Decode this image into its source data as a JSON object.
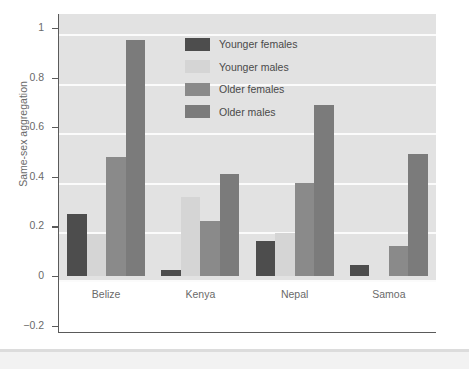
{
  "chart_data": {
    "type": "bar",
    "title": "",
    "xlabel": "Culture",
    "ylabel": "Same-sex aggregation",
    "categories": [
      "Belize",
      "Kenya",
      "Nepal",
      "Samoa"
    ],
    "series": [
      {
        "name": "Younger females",
        "color": "#4d4d4d",
        "values": [
          0.25,
          0.025,
          0.14,
          0.045
        ]
      },
      {
        "name": "Younger males",
        "color": "#d5d5d5",
        "values": [
          0.17,
          0.32,
          0.175,
          0.0
        ]
      },
      {
        "name": "Older females",
        "color": "#8a8a8a",
        "values": [
          0.48,
          0.22,
          0.375,
          0.12
        ]
      },
      {
        "name": "Older males",
        "color": "#7b7b7b",
        "values": [
          0.95,
          0.41,
          0.69,
          0.49
        ]
      }
    ],
    "ylim": [
      -0.2,
      1.08
    ],
    "yticks": [
      1,
      0.8,
      0.6,
      0.4,
      0.2,
      0,
      -0.2
    ],
    "ytick_labels": [
      "1",
      "0.8",
      "0.6",
      "0.4",
      "0.2",
      "0",
      "−0.2"
    ],
    "gridlines": [
      1,
      0.8,
      0.6,
      0.4,
      0.2,
      0
    ],
    "grid": true,
    "legend_position": "top-center",
    "plot_background": "#e2e2e2",
    "grid_color": "#fbfbfb",
    "axis_color": "#5a5a5a",
    "text_color": "#6a6a6a"
  }
}
